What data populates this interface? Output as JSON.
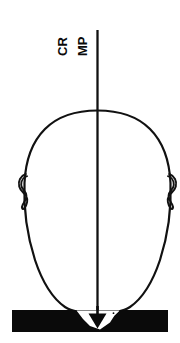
{
  "figure": {
    "canvas": {
      "width": 180,
      "height": 343,
      "background": "#ffffff"
    },
    "labels": {
      "cr": "CR",
      "mp": "MP",
      "orientation": "rotated-90-ccw",
      "color": "#0a0a0a",
      "font_weight": "bold",
      "font_size_px": 13
    },
    "reference_line": {
      "name": "vertical-reference-line",
      "x": 97,
      "y_top": 30,
      "y_bottom": 325,
      "stroke": "#111111",
      "stroke_width": 2.2,
      "arrowhead": "down"
    },
    "head_outline": {
      "name": "head-outline",
      "stroke": "#111111",
      "stroke_width": 2.2,
      "fill": "none",
      "top_y": 110,
      "bottom_y": 312,
      "left_x": 24,
      "right_x": 157
    },
    "ears": {
      "name": "ear-curls",
      "left_x": 26,
      "right_x": 155,
      "y_center": 192,
      "stroke": "#111111",
      "stroke_width": 1.8
    },
    "base_bar": {
      "name": "occlusal-base-bar",
      "x": 12,
      "y": 310,
      "width": 156,
      "height": 22,
      "fill": "#0a0a0a"
    },
    "notch": {
      "name": "white-triangular-notch",
      "fill": "#ffffff",
      "apex_y": 328,
      "left_x": 77,
      "right_x": 118,
      "top_y": 311
    },
    "colors": {
      "ink": "#111111",
      "paper": "#ffffff",
      "bar": "#0a0a0a"
    }
  }
}
